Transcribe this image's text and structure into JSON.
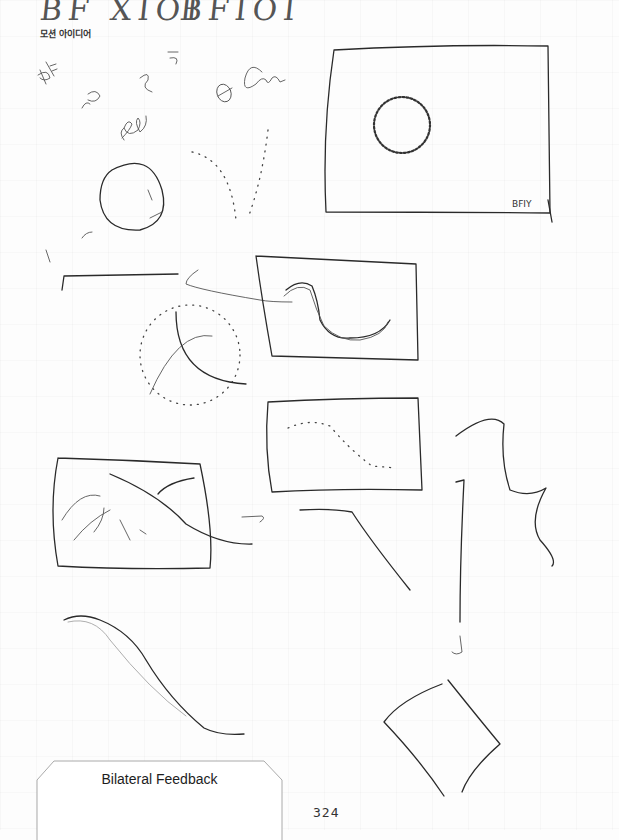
{
  "page": {
    "header_handwriting_left": "BF XIOI",
    "header_handwriting_right": "BFIOI",
    "caption": "모션 아이디어",
    "section_label": "Bilateral Feedback",
    "page_number": "324"
  },
  "sketches": [
    {
      "id": "doodle-notes",
      "description": "handwritten scribbles: BF, ve, 2, circle, Om, cee"
    },
    {
      "id": "frame-with-dotted-ring",
      "description": "large rectangle frame containing a hatched circular ring, signed BFIY",
      "signature": "BFIY"
    },
    {
      "id": "hand-circle",
      "description": "loose hand-drawn circle"
    },
    {
      "id": "dotted-v-trail",
      "description": "dotted converging trails"
    },
    {
      "id": "horizontal-line-arrow",
      "description": "horizontal line with arrow pointing left"
    },
    {
      "id": "frame-with-wave",
      "description": "rectangle frame with s-curve double line"
    },
    {
      "id": "dotted-radial-burst",
      "description": "dotted circle with crossing curves"
    },
    {
      "id": "frame-with-dotted-curve",
      "description": "rectangle frame with dotted descending curve"
    },
    {
      "id": "frame-with-diagonal",
      "description": "rectangle frame with diagonal line crossing scattered marks"
    },
    {
      "id": "arrow-right",
      "description": "small arrow pointing right"
    },
    {
      "id": "descending-line",
      "description": "line going flat then descending"
    },
    {
      "id": "squiggle",
      "description": "wavy squiggle"
    },
    {
      "id": "vertical-arrow-down",
      "description": "long vertical line with downward arrow"
    },
    {
      "id": "descending-s-curve",
      "description": "long s-curve descending to the right"
    },
    {
      "id": "diamond",
      "description": "tilted quadrilateral / diamond shape"
    }
  ]
}
